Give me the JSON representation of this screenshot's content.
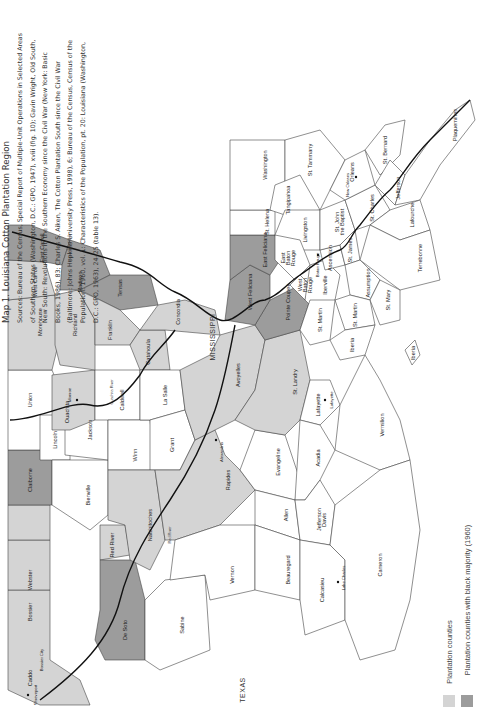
{
  "caption": {
    "title": "Map 1. Louisiana Cotton Plantation Region",
    "sources": "Sources: Bureau of the Census, Special Report of Multiple-Unit Operations in Selected Areas of Southern States (Washington, D.C.: GPO, 1947), xviii (fig. 10); Gavin Wright, Old South, New South: Revolutions in the Southern Economy since the Civil War (New York: Basic Books, 1986), 83; Charles S. Aiken, The Cotton Plantation South since the Civil War (Baltimore: Johns Hopkins University Press, 1998), 6; Bureau of the Census, Census of the Population: 1960, vol. 1: Characteristics of the Population, pt. 20: Louisiana (Washington, D.C.: GPO, 1963), 24–25 (table 13)."
  },
  "colors": {
    "plantation": "#d4d4d4",
    "black_majority": "#9c9c9c",
    "other": "#ffffff",
    "border": "#444444",
    "river": "#111111"
  },
  "states": {
    "mississippi": "MISSISSIPPI",
    "texas": "TEXAS"
  },
  "legend": [
    {
      "label": "Plantation counties",
      "color": "#d4d4d4"
    },
    {
      "label": "Plantation counties with black majority (1960)",
      "color": "#9c9c9c"
    }
  ],
  "parishes": [
    {
      "name": "Caddo",
      "category": "plantation"
    },
    {
      "name": "Bossier",
      "category": "plantation"
    },
    {
      "name": "Webster",
      "category": "plantation"
    },
    {
      "name": "Claiborne",
      "category": "black_majority"
    },
    {
      "name": "Union",
      "category": "other"
    },
    {
      "name": "Morehouse",
      "category": "plantation"
    },
    {
      "name": "West Carroll",
      "category": "plantation"
    },
    {
      "name": "East Carroll",
      "category": "black_majority"
    },
    {
      "name": "Madison",
      "category": "black_majority"
    },
    {
      "name": "Tensas",
      "category": "black_majority"
    },
    {
      "name": "Richland",
      "category": "plantation"
    },
    {
      "name": "Franklin",
      "category": "plantation"
    },
    {
      "name": "Ouachita",
      "category": "plantation"
    },
    {
      "name": "Lincoln",
      "category": "other"
    },
    {
      "name": "Jackson",
      "category": "other"
    },
    {
      "name": "Bienville",
      "category": "other"
    },
    {
      "name": "Red River",
      "category": "plantation"
    },
    {
      "name": "De Soto",
      "category": "black_majority"
    },
    {
      "name": "Natchitoches",
      "category": "plantation"
    },
    {
      "name": "Sabine",
      "category": "other"
    },
    {
      "name": "Winn",
      "category": "other"
    },
    {
      "name": "Caldwell",
      "category": "other"
    },
    {
      "name": "Catahoula",
      "category": "plantation"
    },
    {
      "name": "Concordia",
      "category": "plantation"
    },
    {
      "name": "La Salle",
      "category": "other"
    },
    {
      "name": "Grant",
      "category": "other"
    },
    {
      "name": "Rapides",
      "category": "plantation"
    },
    {
      "name": "Avoyelles",
      "category": "plantation"
    },
    {
      "name": "Vernon",
      "category": "other"
    },
    {
      "name": "Beauregard",
      "category": "other"
    },
    {
      "name": "Allen",
      "category": "other"
    },
    {
      "name": "Evangeline",
      "category": "other"
    },
    {
      "name": "St. Landry",
      "category": "plantation"
    },
    {
      "name": "Pointe Coupee",
      "category": "black_majority"
    },
    {
      "name": "West Feliciana",
      "category": "black_majority"
    },
    {
      "name": "East Feliciana",
      "category": "black_majority"
    },
    {
      "name": "St. Helena",
      "category": "other"
    },
    {
      "name": "Washington",
      "category": "other"
    },
    {
      "name": "St. Tammany",
      "category": "other"
    },
    {
      "name": "Tangipahoa",
      "category": "other"
    },
    {
      "name": "Livingston",
      "category": "other"
    },
    {
      "name": "East Baton Rouge",
      "category": "other"
    },
    {
      "name": "West Baton Rouge",
      "category": "other"
    },
    {
      "name": "Iberville",
      "category": "other"
    },
    {
      "name": "Ascension",
      "category": "other"
    },
    {
      "name": "St. James",
      "category": "other"
    },
    {
      "name": "St. John the Baptist",
      "category": "other"
    },
    {
      "name": "St. Charles",
      "category": "other"
    },
    {
      "name": "Orleans",
      "category": "other"
    },
    {
      "name": "St. Bernard",
      "category": "other"
    },
    {
      "name": "Jefferson",
      "category": "other"
    },
    {
      "name": "Plaquemines",
      "category": "other"
    },
    {
      "name": "Lafourche",
      "category": "other"
    },
    {
      "name": "Terrebonne",
      "category": "other"
    },
    {
      "name": "Assumption",
      "category": "other"
    },
    {
      "name": "St. Martin",
      "category": "other"
    },
    {
      "name": "St. Mary",
      "category": "other"
    },
    {
      "name": "Iberia",
      "category": "other"
    },
    {
      "name": "Lafayette",
      "category": "other"
    },
    {
      "name": "Acadia",
      "category": "other"
    },
    {
      "name": "Vermilion",
      "category": "other"
    },
    {
      "name": "Jefferson Davis",
      "category": "other"
    },
    {
      "name": "Calcasieu",
      "category": "other"
    },
    {
      "name": "Cameron",
      "category": "other"
    }
  ],
  "labels": {
    "caddo": "Caddo",
    "bossier": "Bossier",
    "webster": "Webster",
    "claiborne": "Claiborne",
    "union": "Union",
    "morehouse": "Morehouse",
    "west_carroll": "West Carroll",
    "east_carroll": "East Carroll",
    "madison": "Madison",
    "tensas": "Tensas",
    "richland": "Richland",
    "franklin": "Franklin",
    "ouachita": "Ouachita",
    "lincoln": "Lincoln",
    "jackson": "Jackson",
    "bienville": "Bienville",
    "red_river": "Red River",
    "de_soto": "De Soto",
    "natchitoches": "Natchitoches",
    "sabine": "Sabine",
    "winn": "Winn",
    "caldwell": "Caldwell",
    "catahoula": "Catahoula",
    "concordia": "Concordia",
    "la_salle": "La Salle",
    "grant": "Grant",
    "rapides": "Rapides",
    "avoyelles": "Avoyelles",
    "vernon": "Vernon",
    "beauregard": "Beauregard",
    "allen": "Allen",
    "evangeline": "Evangeline",
    "st_landry": "St. Landry",
    "pointe_coupee": "Pointe Coupee",
    "west_feliciana": "West Feliciana",
    "east_feliciana": "East Feliciana",
    "st_helena": "St. Helena",
    "washington": "Washington",
    "st_tammany": "St. Tammany",
    "tangipahoa": "Tangipahoa",
    "livingston": "Livingston",
    "east_baton_rouge": "East Baton Rouge",
    "west_baton_rouge": "West Baton Rouge",
    "iberville": "Iberville",
    "ascension": "Ascension",
    "st_james": "St. James",
    "st_john": "St. John the Baptist",
    "st_charles": "St. Charles",
    "orleans": "Orleans",
    "st_bernard": "St. Bernard",
    "jefferson": "Jefferson",
    "plaquemines": "Plaquemines",
    "lafourche": "Lafourche",
    "terrebonne": "Terrebonne",
    "assumption": "Assumption",
    "st_martin": "St. Martin",
    "st_martin_2": "St. Martin",
    "st_mary": "St. Mary",
    "iberia": "Iberia",
    "iberia_2": "Iberia",
    "lafayette": "Lafayette",
    "acadia": "Acadia",
    "vermilion": "Vermilion",
    "jefferson_davis": "Jefferson Davis",
    "calcasieu": "Calcasieu",
    "cameron": "Cameron"
  },
  "cities": {
    "shreveport": "Shreveport",
    "bossier_city": "Bossier City",
    "monroe": "Monroe",
    "alexandria": "Alexandria",
    "lafayette": "Lafayette",
    "lake_charles": "Lake Charles",
    "baton_rouge": "Baton Rouge",
    "new_orleans": "New Orleans"
  },
  "rivers": {
    "red": "Red River",
    "mississippi": "Mississippi River",
    "ouachita": "Ouachita River"
  }
}
